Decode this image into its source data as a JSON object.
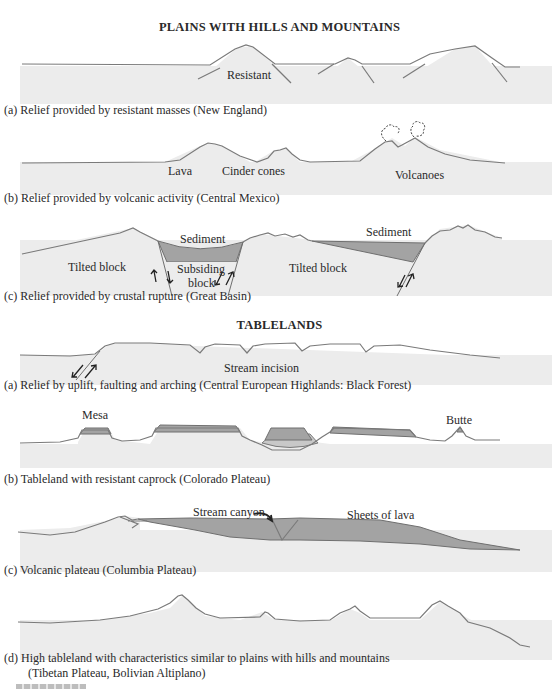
{
  "sections": {
    "plains": {
      "title": "PLAINS WITH HILLS AND MOUNTAINS",
      "panels": [
        {
          "id": "a",
          "caption": "(a) Relief provided by resistant masses (New England)",
          "labels": [
            "Resistant"
          ]
        },
        {
          "id": "b",
          "caption": "(b) Relief provided by volcanic activity (Central Mexico)",
          "labels": [
            "Lava",
            "Cinder cones",
            "Volcanoes"
          ]
        },
        {
          "id": "c",
          "caption": "(c) Relief provided by crustal rupture (Great Basin)",
          "labels": [
            "Sediment",
            "Tilted block",
            "Subsiding",
            "block",
            "Tilted block",
            "Sediment"
          ]
        }
      ]
    },
    "tablelands": {
      "title": "TABLELANDS",
      "panels": [
        {
          "id": "a",
          "caption": "(a) Relief by uplift, faulting and arching (Central European Highlands: Black Forest)",
          "labels": [
            "Stream incision"
          ]
        },
        {
          "id": "b",
          "caption": "(b) Tableland with resistant caprock (Colorado Plateau)",
          "labels": [
            "Mesa",
            "Butte"
          ]
        },
        {
          "id": "c",
          "caption": "(c) Volcanic plateau (Columbia Plateau)",
          "labels": [
            "Stream canyon",
            "Sheets of lava"
          ]
        },
        {
          "id": "d",
          "caption_line1": "(d)  High tableland with characteristics similar to plains with hills and mountains",
          "caption_line2": "(Tibetan Plateau, Bolivian Altiplano)",
          "labels": []
        }
      ]
    }
  },
  "colors": {
    "ground": "#ececec",
    "outline": "#7a7a7a",
    "sediment": "#a3a3a3",
    "light_sediment": "#c8c8c8"
  }
}
